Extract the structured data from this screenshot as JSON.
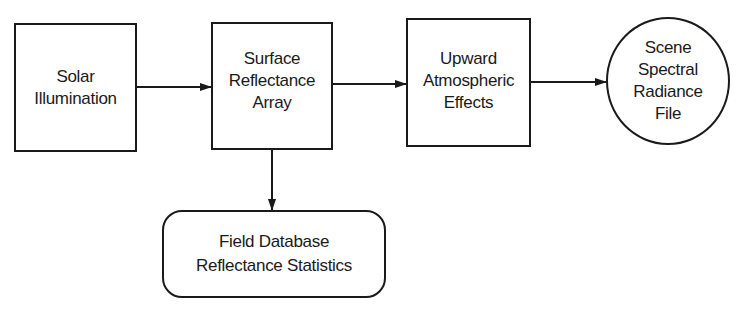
{
  "diagram": {
    "type": "flowchart",
    "nodes": [
      {
        "id": "solar",
        "shape": "rectangle",
        "lines": [
          "Solar",
          "Illumination"
        ]
      },
      {
        "id": "surface",
        "shape": "rectangle",
        "lines": [
          "Surface",
          "Reflectance",
          "Array"
        ]
      },
      {
        "id": "upward",
        "shape": "rectangle",
        "lines": [
          "Upward",
          "Atmospheric",
          "Effects"
        ]
      },
      {
        "id": "scene",
        "shape": "circle",
        "lines": [
          "Scene",
          "Spectral",
          "Radiance",
          "File"
        ]
      },
      {
        "id": "field",
        "shape": "rounded-rectangle",
        "lines": [
          "Field Database",
          "Reflectance Statistics"
        ]
      }
    ],
    "edges": [
      {
        "from": "solar",
        "to": "surface"
      },
      {
        "from": "surface",
        "to": "upward"
      },
      {
        "from": "upward",
        "to": "scene"
      },
      {
        "from": "surface",
        "to": "field"
      }
    ],
    "colors": {
      "stroke": "#1a1a1a",
      "background": "#ffffff"
    }
  }
}
